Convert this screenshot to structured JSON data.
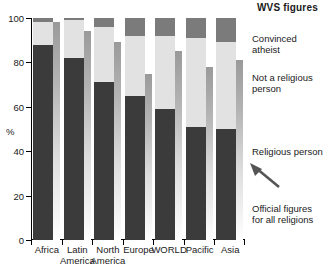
{
  "chart": {
    "title": "WVS figures",
    "ylabel": "%",
    "yticks": [
      "0",
      "20",
      "40",
      "60",
      "80",
      "100"
    ]
  },
  "legend": {
    "atheist": "Convinced\natheist",
    "notrel": "Not a\nreligious\nperson",
    "religious": "Religious\nperson",
    "official": "Official\nfigures\nfor all\nreligions"
  },
  "colors": {
    "religious": "#3b3b3b",
    "not_religious": "#e2e2e2",
    "atheist": "#7b7b7b",
    "official": "#b4b4b4",
    "background": "#ffffff",
    "axis": "#000000"
  },
  "chart_data": {
    "type": "bar",
    "title": "WVS figures",
    "xlabel": "",
    "ylabel": "%",
    "ylim": [
      0,
      100
    ],
    "grid": false,
    "legend_position": "right",
    "stacked": true,
    "categories": [
      "Africa",
      "Latin\nAmerica",
      "North\nAmerica",
      "Europe",
      "WORLD",
      "Pacific",
      "Asia"
    ],
    "series": [
      {
        "name": "Religious person",
        "values": [
          88,
          82,
          71,
          65,
          59,
          51,
          50
        ]
      },
      {
        "name": "Not a religious person",
        "values": [
          10,
          17,
          25,
          27,
          33,
          40,
          39
        ]
      },
      {
        "name": "Convinced atheist",
        "values": [
          2,
          1,
          4,
          8,
          8,
          9,
          11
        ]
      }
    ],
    "cumulative": [
      {
        "name": "Religious person (top)",
        "values": [
          88,
          82,
          71,
          65,
          59,
          51,
          50
        ]
      },
      {
        "name": "Not a religious person (top)",
        "values": [
          98,
          99,
          96,
          92,
          92,
          91,
          89
        ]
      },
      {
        "name": "Convinced atheist (top)",
        "values": [
          100,
          100,
          100,
          100,
          100,
          100,
          100
        ]
      }
    ],
    "overlay": {
      "name": "Official figures for all religions",
      "values": [
        98,
        94,
        89,
        75,
        85,
        78,
        81
      ]
    }
  }
}
